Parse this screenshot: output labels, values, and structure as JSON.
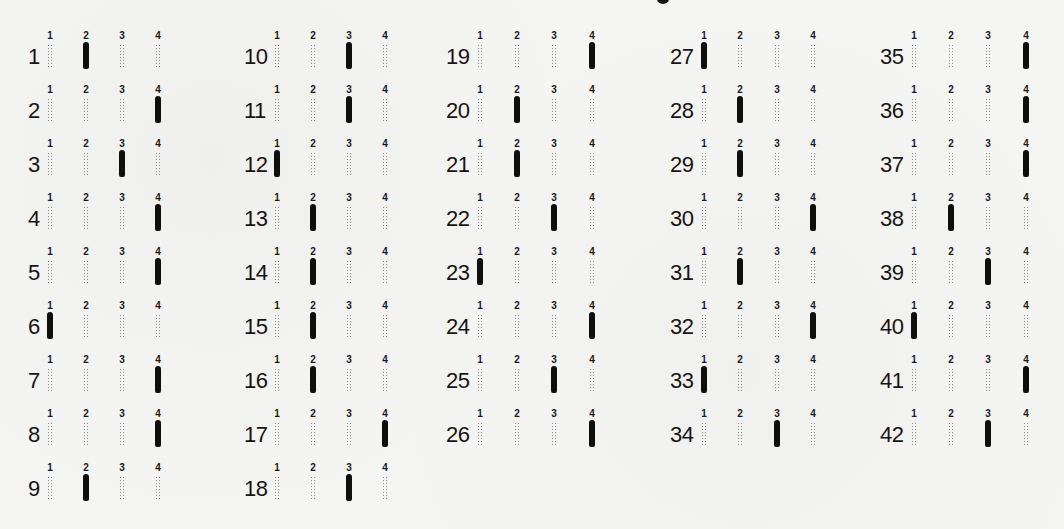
{
  "sheet": {
    "type": "multiple-choice answer sheet",
    "option_labels": [
      "1",
      "2",
      "3",
      "4"
    ],
    "columns": [
      {
        "left": 28,
        "option_x": [
          22,
          58,
          94,
          130
        ],
        "questions": [
          {
            "number": "1",
            "selected": 2
          },
          {
            "number": "2",
            "selected": 4
          },
          {
            "number": "3",
            "selected": 3
          },
          {
            "number": "4",
            "selected": 4
          },
          {
            "number": "5",
            "selected": 4
          },
          {
            "number": "6",
            "selected": 1
          },
          {
            "number": "7",
            "selected": 4
          },
          {
            "number": "8",
            "selected": 4
          },
          {
            "number": "9",
            "selected": 2
          }
        ]
      },
      {
        "left": 244,
        "option_x": [
          33,
          69,
          105,
          141
        ],
        "questions": [
          {
            "number": "10",
            "selected": 3
          },
          {
            "number": "11",
            "selected": 3
          },
          {
            "number": "12",
            "selected": 1
          },
          {
            "number": "13",
            "selected": 2
          },
          {
            "number": "14",
            "selected": 2
          },
          {
            "number": "15",
            "selected": 2
          },
          {
            "number": "16",
            "selected": 2
          },
          {
            "number": "17",
            "selected": 4
          },
          {
            "number": "18",
            "selected": 3
          }
        ]
      },
      {
        "left": 446,
        "option_x": [
          34,
          71,
          108,
          146
        ],
        "questions": [
          {
            "number": "19",
            "selected": 4
          },
          {
            "number": "20",
            "selected": 2
          },
          {
            "number": "21",
            "selected": 2
          },
          {
            "number": "22",
            "selected": 3
          },
          {
            "number": "23",
            "selected": 1
          },
          {
            "number": "24",
            "selected": 4
          },
          {
            "number": "25",
            "selected": 3
          },
          {
            "number": "26",
            "selected": 4
          }
        ]
      },
      {
        "left": 670,
        "option_x": [
          34,
          70,
          107,
          143
        ],
        "questions": [
          {
            "number": "27",
            "selected": 1
          },
          {
            "number": "28",
            "selected": 2
          },
          {
            "number": "29",
            "selected": 2
          },
          {
            "number": "30",
            "selected": 4
          },
          {
            "number": "31",
            "selected": 2
          },
          {
            "number": "32",
            "selected": 4
          },
          {
            "number": "33",
            "selected": 1
          },
          {
            "number": "34",
            "selected": 3
          }
        ]
      },
      {
        "left": 880,
        "option_x": [
          34,
          71,
          108,
          146
        ],
        "questions": [
          {
            "number": "35",
            "selected": 4
          },
          {
            "number": "36",
            "selected": 4
          },
          {
            "number": "37",
            "selected": 4
          },
          {
            "number": "38",
            "selected": 2
          },
          {
            "number": "39",
            "selected": 3
          },
          {
            "number": "40",
            "selected": 1
          },
          {
            "number": "41",
            "selected": 4
          },
          {
            "number": "42",
            "selected": 3
          }
        ]
      }
    ]
  }
}
